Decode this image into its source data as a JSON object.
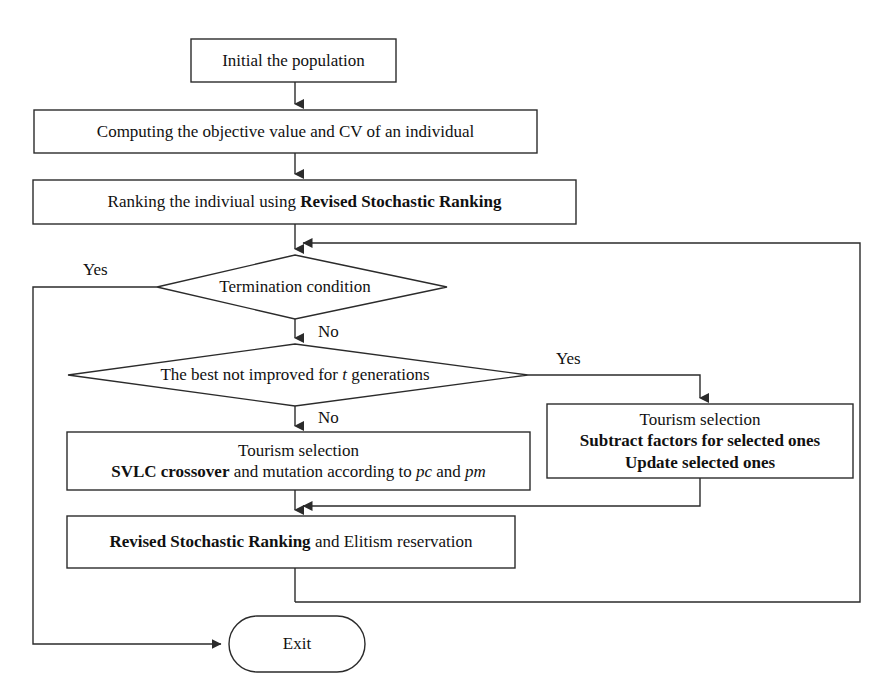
{
  "diagram": {
    "type": "flowchart",
    "stroke_color": "#2b2b2b",
    "fill_color": "#ffffff",
    "text_color": "#111111"
  },
  "nodes": {
    "initial_population": {
      "shape": "process",
      "label": "Initial the population"
    },
    "computing_objective": {
      "shape": "process",
      "label": "Computing the objective value and CV of an individual"
    },
    "ranking_individual": {
      "shape": "process",
      "line1_normal": "Ranking the indiviual using ",
      "line1_bold": "Revised Stochastic Ranking"
    },
    "termination_condition": {
      "shape": "decision",
      "label": "Termination condition"
    },
    "best_not_improved": {
      "shape": "decision",
      "prefix": "The best not improved for ",
      "italic": "t",
      "suffix": " generations"
    },
    "tourism_selection_left": {
      "shape": "process",
      "line1": "Tourism selection",
      "line2_bold": "SVLC crossover",
      "line2_mid": " and mutation according to ",
      "line2_italic1": "pc",
      "line2_and": " and ",
      "line2_italic2": "pm"
    },
    "tourism_selection_right": {
      "shape": "process",
      "line1": "Tourism selection",
      "line2": "Subtract factors for selected ones",
      "line3": "Update selected ones"
    },
    "revised_ranking_elitism": {
      "shape": "process",
      "line1_bold": "Revised Stochastic Ranking",
      "line1_normal": " and Elitism reservation"
    },
    "exit": {
      "shape": "terminator",
      "label": "Exit"
    }
  },
  "edge_labels": {
    "termination_yes": "Yes",
    "termination_no": "No",
    "best_yes": "Yes",
    "best_no": "No"
  }
}
